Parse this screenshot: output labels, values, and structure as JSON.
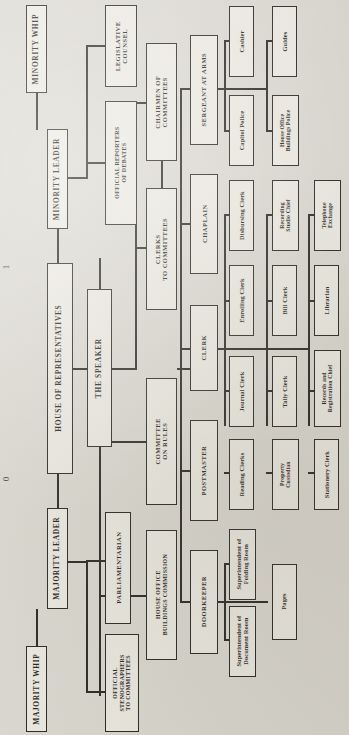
{
  "chart_data": {
    "type": "diagram",
    "orientation": "rotated-90",
    "root": "HOUSE OF REPRESENTATIVES"
  },
  "page_marks": {
    "left": "0",
    "right": "1"
  },
  "nodes": {
    "house_of_representatives": "HOUSE OF REPRESENTATIVES",
    "majority_leader": "MAJORITY LEADER",
    "majority_whip": "MAJORITY WHIP",
    "minority_leader": "MINORITY LEADER",
    "minority_whip": "MINORITY WHIP",
    "the_speaker": "THE SPEAKER",
    "parliamentarian": "PARLIAMENTARIAN",
    "official_stenographers": "OFFICIAL\nSTENOGRAPHERS\nTO COMMITTEES",
    "official_reporters": "OFFICIAL REPORTERS\nOF DEBATES",
    "legislative_counsel": "LEGISLATIVE\nCOUNSEL",
    "chairmen_of_committees": "CHAIRMEN OF\nCOMMITTEES",
    "clerks_to_committees": "CLERKS\nTO COMMITTEES",
    "committee_on_rules": "COMMITTEE\nON RULES",
    "house_office_buildings_commission": "HOUSE OFFICE\nBUILDINGS COMMISSION",
    "sergeant_at_arms": "SERGEANT AT ARMS",
    "chaplain": "CHAPLAIN",
    "clerk": "CLERK",
    "postmaster": "POSTMASTER",
    "doorkeeper": "DOORKEEPER",
    "cashier": "Cashier",
    "capitol_police": "Capitol Police",
    "guides": "Guides",
    "house_office_buildings_police": "House Office\nBuildings Police",
    "disbursing_clerk": "Disbursing Clerk",
    "enrolling_clerk": "Enrolling Clerk",
    "journal_clerk": "Journal Clerk",
    "reading_clerks": "Reading Clerks",
    "recording_studio_chief": "Recording\nStudio Chief",
    "bill_clerk": "Bill Clerk",
    "tally_clerk": "Tally Clerk",
    "property_custodian": "Property\nCustodian",
    "telephone_exchange": "Telephone\nExchange",
    "librarian": "Librarian",
    "records_and_registration_chief": "Records and\nRegistration Chief",
    "stationery_clerk": "Stationery Clerk",
    "superintendent_of_folding_room": "Superintendent of\nFolding Room",
    "superintendent_of_document_room": "Superintendent of\nDocument Room",
    "pages": "Pages"
  }
}
